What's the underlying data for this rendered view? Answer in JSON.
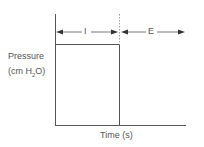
{
  "diagram": {
    "y_label_line1": "Pressure",
    "y_label_line2_prefix": "(cm H",
    "y_label_line2_sub": "2",
    "y_label_line2_suffix": "O)",
    "x_label": "Time (s)",
    "phase_inspiration": "I",
    "phase_expiration": "E",
    "waveform": "square pressure waveform: constant pressure during inspiration (I), drops to baseline at expiration (E)",
    "line_color": "#555555"
  }
}
